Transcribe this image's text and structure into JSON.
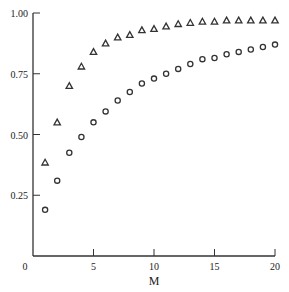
{
  "chart_data": {
    "type": "scatter",
    "title": "",
    "xlabel": "M",
    "ylabel": "",
    "xlim": [
      0,
      20
    ],
    "ylim": [
      0,
      1.0
    ],
    "grid": false,
    "legend": null,
    "x_ticks": [
      0,
      5,
      10,
      15,
      20
    ],
    "x_tick_labels": [
      "0",
      "5",
      "10",
      "15",
      "20"
    ],
    "y_ticks": [
      0.25,
      0.5,
      0.75,
      1.0
    ],
    "y_tick_labels": [
      "0.25",
      "0.50",
      "0.75",
      "1.00"
    ],
    "x": [
      1,
      2,
      3,
      4,
      5,
      6,
      7,
      8,
      9,
      10,
      11,
      12,
      13,
      14,
      15,
      16,
      17,
      18,
      19,
      20
    ],
    "series": [
      {
        "name": "triangles",
        "marker": "triangle",
        "values": [
          0.385,
          0.55,
          0.7,
          0.78,
          0.84,
          0.875,
          0.9,
          0.91,
          0.93,
          0.935,
          0.945,
          0.955,
          0.96,
          0.965,
          0.965,
          0.97,
          0.97,
          0.97,
          0.97,
          0.97
        ]
      },
      {
        "name": "circles",
        "marker": "circle",
        "values": [
          0.19,
          0.31,
          0.425,
          0.49,
          0.55,
          0.595,
          0.64,
          0.675,
          0.71,
          0.73,
          0.75,
          0.77,
          0.79,
          0.81,
          0.815,
          0.83,
          0.84,
          0.85,
          0.86,
          0.87
        ]
      }
    ]
  },
  "colors": {
    "axis": "#333333",
    "marker": "#333333",
    "background": "#ffffff"
  }
}
